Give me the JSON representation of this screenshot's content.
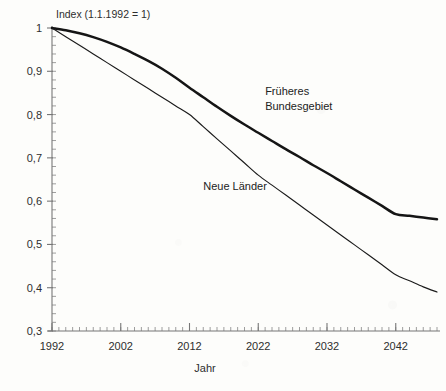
{
  "chart_data": {
    "type": "line",
    "title": "",
    "note": "Index (1.1.1992 = 1)",
    "xlabel": "Jahr",
    "ylabel": "",
    "xlim": [
      1992,
      2048
    ],
    "ylim": [
      0.3,
      1.0
    ],
    "grid": false,
    "legend_position": "inline-annotations",
    "x_ticks": [
      1992,
      2002,
      2012,
      2022,
      2032,
      2042
    ],
    "x_tick_labels": [
      "1992",
      "2002",
      "2012",
      "2022",
      "2032",
      "2042"
    ],
    "x_minor_tick_step": 1,
    "y_ticks": [
      0.3,
      0.4,
      0.5,
      0.6,
      0.7,
      0.8,
      0.9,
      1.0
    ],
    "y_tick_labels": [
      "0,3",
      "0,4",
      "0,5",
      "0,6",
      "0,7",
      "0,8",
      "0,9",
      "1"
    ],
    "y_minor_tick_step": 0.02,
    "x": [
      1992,
      1994,
      1996,
      1998,
      2000,
      2002,
      2004,
      2006,
      2008,
      2010,
      2012,
      2014,
      2016,
      2018,
      2020,
      2022,
      2024,
      2026,
      2028,
      2030,
      2032,
      2034,
      2036,
      2038,
      2040,
      2042,
      2044,
      2046,
      2048
    ],
    "series": [
      {
        "name": "Früheres Bundesgebiet",
        "style": "thick",
        "color": "#151515",
        "values": [
          1.0,
          0.995,
          0.988,
          0.979,
          0.968,
          0.955,
          0.94,
          0.924,
          0.906,
          0.885,
          0.862,
          0.84,
          0.818,
          0.797,
          0.777,
          0.758,
          0.739,
          0.72,
          0.702,
          0.683,
          0.665,
          0.646,
          0.627,
          0.608,
          0.589,
          0.57,
          0.566,
          0.562,
          0.558
        ]
      },
      {
        "name": "Neue Länder",
        "style": "thin",
        "color": "#1b1b1b",
        "values": [
          1.0,
          0.98,
          0.96,
          0.94,
          0.92,
          0.9,
          0.88,
          0.86,
          0.84,
          0.82,
          0.8,
          0.772,
          0.744,
          0.716,
          0.688,
          0.66,
          0.637,
          0.614,
          0.591,
          0.568,
          0.545,
          0.522,
          0.499,
          0.476,
          0.453,
          0.43,
          0.416,
          0.402,
          0.39
        ]
      }
    ],
    "annotations": [
      {
        "text_line1": "Früheres",
        "text_line2": "Bundesgebiet",
        "x": 2023,
        "y": 0.845
      },
      {
        "text_line1": "Neue Länder",
        "text_line2": "",
        "x": 2014,
        "y": 0.625
      }
    ]
  }
}
